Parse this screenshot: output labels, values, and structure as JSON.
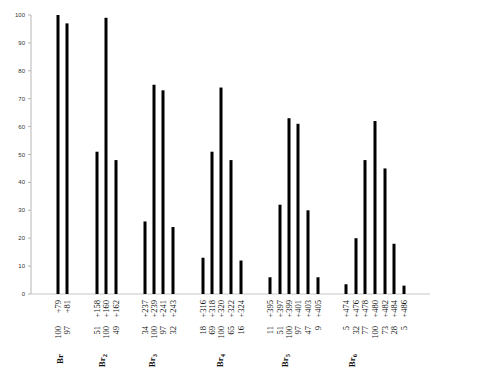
{
  "chart_data": {
    "type": "bar",
    "title": "",
    "xlabel": "",
    "ylabel": "",
    "ylim": [
      0,
      100
    ],
    "yticks": [
      0,
      10,
      20,
      30,
      40,
      50,
      60,
      70,
      80,
      90,
      100
    ],
    "grid": false,
    "legend": null,
    "groups": [
      {
        "name": "Br",
        "sub": "",
        "categories": [
          "100  +79",
          "97  +81"
        ],
        "intensity_labels": [
          100,
          97
        ],
        "mass_labels": [
          "+79",
          "+81"
        ],
        "values": [
          100,
          97
        ]
      },
      {
        "name": "Br",
        "sub": "2",
        "categories": [
          "51  +158",
          "100  +160",
          "49  +162"
        ],
        "intensity_labels": [
          51,
          100,
          49
        ],
        "mass_labels": [
          "+158",
          "+160",
          "+162"
        ],
        "values": [
          51,
          99,
          48
        ]
      },
      {
        "name": "Br",
        "sub": "3",
        "categories": [
          "34  +237",
          "100  +239",
          "97  +241",
          "32  +243"
        ],
        "intensity_labels": [
          34,
          100,
          97,
          32
        ],
        "mass_labels": [
          "+237",
          "+239",
          "+241",
          "+243"
        ],
        "values": [
          26,
          75,
          73,
          24
        ]
      },
      {
        "name": "Br",
        "sub": "4",
        "categories": [
          "18  +316",
          "69  +318",
          "100  +320",
          "65  +322",
          "16  +324"
        ],
        "intensity_labels": [
          18,
          69,
          100,
          65,
          16
        ],
        "mass_labels": [
          "+316",
          "+318",
          "+320",
          "+322",
          "+324"
        ],
        "values": [
          13,
          51,
          74,
          48,
          12
        ]
      },
      {
        "name": "Br",
        "sub": "5",
        "categories": [
          "11  +395",
          "51  +397",
          "100  +399",
          "97  +401",
          "47  +403",
          "9  +405"
        ],
        "intensity_labels": [
          11,
          51,
          100,
          97,
          47,
          9
        ],
        "mass_labels": [
          "+395",
          "+397",
          "+399",
          "+401",
          "+403",
          "+405"
        ],
        "values": [
          6,
          32,
          63,
          61,
          30,
          6
        ]
      },
      {
        "name": "Br",
        "sub": "6",
        "categories": [
          "5  +474",
          "32  +476",
          "77  +478",
          "100  +480",
          "73  +482",
          "28  +484",
          "5  +486"
        ],
        "intensity_labels": [
          5,
          32,
          77,
          100,
          73,
          28,
          5
        ],
        "mass_labels": [
          "+474",
          "+476",
          "+478",
          "+480",
          "+482",
          "+484",
          "+486"
        ],
        "values": [
          3.5,
          20,
          48,
          62,
          45,
          18,
          3
        ]
      }
    ],
    "bar_x": [
      [
        58,
        67
      ],
      [
        97,
        106,
        116
      ],
      [
        145,
        154,
        163,
        173
      ],
      [
        203,
        212,
        221,
        231,
        241
      ],
      [
        270,
        280,
        289,
        298,
        308,
        318
      ],
      [
        346,
        356,
        365,
        375,
        385,
        394,
        404
      ]
    ],
    "group_label_x": [
      60,
      102,
      152,
      220,
      285,
      352
    ],
    "colors": {
      "bar": "#000000",
      "axis": "#999999",
      "text": "#222222"
    }
  }
}
